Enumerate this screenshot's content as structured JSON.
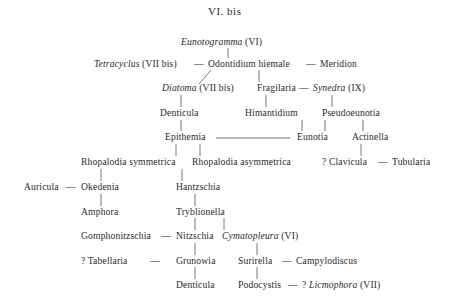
{
  "title": "VI. bis",
  "nodes": {
    "eunotogramma": {
      "name": "Eunotogramma",
      "suffix": "(VI)"
    },
    "tetracyclus": {
      "name": "Tetracyclus",
      "suffix": "(VII bis)"
    },
    "odontidium": {
      "name": "Odontidium hiemale"
    },
    "meridion": {
      "name": "Meridion"
    },
    "diatoma": {
      "name": "Diatoma",
      "suffix": "(VII bis)"
    },
    "fragilaria": {
      "name": "Fragilaria"
    },
    "synedra": {
      "name": "Synedra",
      "suffix": "(IX)"
    },
    "denticula_top": {
      "name": "Denticula"
    },
    "himantidium": {
      "name": "Himantidium"
    },
    "pseudoeunotia": {
      "name": "Pseudoeunotia"
    },
    "epithemia": {
      "name": "Epithemia"
    },
    "eunotia": {
      "name": "Eunotia"
    },
    "actinella": {
      "name": "Actinella"
    },
    "rhopalodia_sym": {
      "name": "Rhopalodia symmetrica"
    },
    "rhopalodia_asym": {
      "name": "Rhopalodia asymmetrica"
    },
    "clavicula": {
      "name": "? Clavicula"
    },
    "tubularia": {
      "name": "Tubularia"
    },
    "auricula": {
      "name": "Auricula"
    },
    "okedenia": {
      "name": "Okedenia"
    },
    "hantzschia": {
      "name": "Hantzschia"
    },
    "amphora": {
      "name": "Amphora"
    },
    "tryblionella": {
      "name": "Tryblionella"
    },
    "gomphonitzschia": {
      "name": "Gomphonitzschia"
    },
    "nitzschia": {
      "name": "Nitzschia"
    },
    "cymatopleura": {
      "name": "Cymatopleura",
      "suffix": "(VI)"
    },
    "tabellaria": {
      "name": "? Tabellaria"
    },
    "grunowia": {
      "name": "Grunowia"
    },
    "surirella": {
      "name": "Surirella"
    },
    "campylodiscus": {
      "name": "Campylodiscus"
    },
    "denticula_bottom": {
      "name": "Denticula"
    },
    "podocystis": {
      "name": "Podocystis"
    },
    "liemophora": {
      "prefix": "?",
      "name": "Licmophora",
      "suffix": "(VII)"
    }
  },
  "connector": "—"
}
